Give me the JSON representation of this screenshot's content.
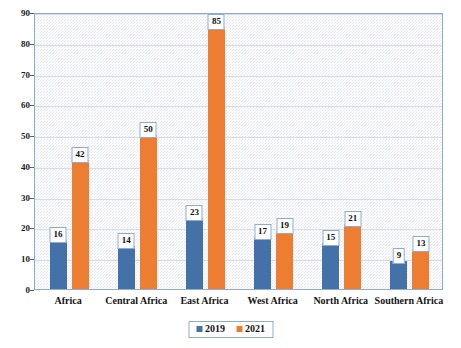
{
  "chart_data": {
    "type": "bar",
    "title": "",
    "xlabel": "",
    "ylabel": "",
    "ylim": [
      0,
      90
    ],
    "ytick_step": 10,
    "yticks": [
      0,
      10,
      20,
      30,
      40,
      50,
      60,
      70,
      80,
      90
    ],
    "grid": true,
    "legend_position": "bottom",
    "categories": [
      "Africa",
      "Central Africa",
      "East Africa",
      "West Africa",
      "North Africa",
      "Southern Africa"
    ],
    "series": [
      {
        "name": "2019",
        "color": "#4472a8",
        "values": [
          16,
          14,
          23,
          17,
          15,
          9
        ]
      },
      {
        "name": "2021",
        "color": "#ed7d31",
        "values": [
          42,
          50,
          85,
          19,
          21,
          13
        ]
      }
    ]
  },
  "legend": {
    "items": [
      {
        "label": "2019"
      },
      {
        "label": "2021"
      }
    ]
  }
}
